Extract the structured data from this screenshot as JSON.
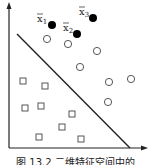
{
  "figure": {
    "caption": "图 13.2 二维特征空间中的",
    "axes": {
      "origin": [
        9,
        148
      ],
      "x_end": 148,
      "y_end": 2,
      "color": "#222222"
    },
    "separator_line": {
      "from": [
        17,
        34
      ],
      "to": [
        130,
        148
      ],
      "color": "#222222"
    },
    "labeled_points": [
      {
        "label": "x",
        "subscript": "1",
        "pos": [
          52,
          25
        ],
        "label_pos": [
          37,
          22
        ]
      },
      {
        "label": "x",
        "subscript": "2",
        "pos": [
          77,
          34
        ],
        "label_pos": [
          63,
          31
        ]
      },
      {
        "label": "x",
        "subscript": "3",
        "pos": [
          93,
          18
        ],
        "label_pos": [
          79,
          15
        ]
      }
    ],
    "circles": [
      [
        47,
        39
      ],
      [
        68,
        44
      ],
      [
        97,
        51
      ],
      [
        80,
        67
      ],
      [
        109,
        82
      ],
      [
        131,
        79
      ],
      [
        108,
        102
      ]
    ],
    "squares": [
      [
        23,
        81
      ],
      [
        45,
        86
      ],
      [
        25,
        108
      ],
      [
        41,
        106
      ],
      [
        72,
        114
      ],
      [
        62,
        127
      ],
      [
        39,
        137
      ],
      [
        81,
        139
      ]
    ]
  }
}
